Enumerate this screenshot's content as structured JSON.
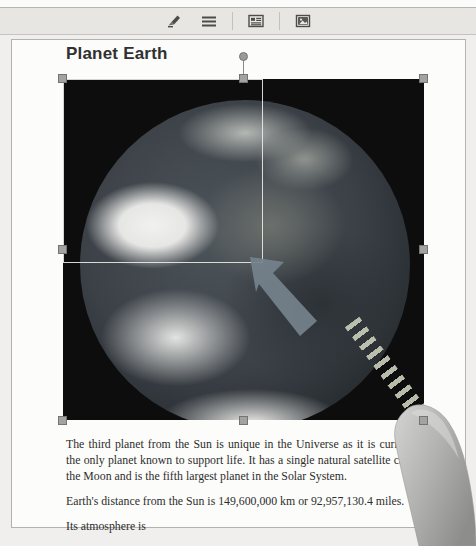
{
  "toolbar": {
    "icons": [
      {
        "name": "pen-icon",
        "label": "Edit"
      },
      {
        "name": "lines-icon",
        "label": "Paragraph"
      },
      {
        "name": "layout-icon",
        "label": "Format"
      },
      {
        "name": "image-icon",
        "label": "Insert image"
      }
    ]
  },
  "document": {
    "title": "Planet Earth",
    "paragraphs": [
      "The third planet from the Sun is unique in the Universe as it is currently the only planet known to support life. It has a single natural satellite called the Moon and is the fifth largest planet in the Solar System.",
      "Earth's distance from the Sun is 149,600,000 km or 92,957,130.4 miles.",
      "Its atmosphere is"
    ]
  },
  "image_selection": {
    "description": "Photograph of planet Earth from space, selected with resize handles",
    "handle_color": "#a3a3a1",
    "crop_outline_color": "#ececE6",
    "drag_arrow_color": "#75828c",
    "stripe_color": "#c6ccb8"
  },
  "colors": {
    "background": "#f0efed",
    "toolbar_bg": "#e7e6e3",
    "page_bg": "#fcfcfa",
    "image_bg": "#0d0d0d",
    "text": "#2d2d2d"
  }
}
